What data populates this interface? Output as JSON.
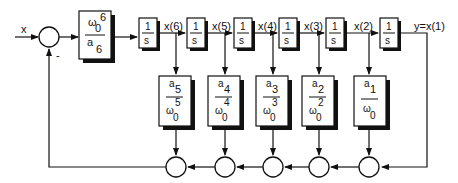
{
  "diagram": {
    "input_label": "x",
    "minus_sign": "-",
    "gain_block": {
      "num_sym": "ω",
      "num_sub": "0",
      "num_sup": "6",
      "den_sym": "a",
      "den_sub": "6"
    },
    "integrators": [
      {
        "num": "1",
        "den": "s",
        "out_label": "x(6)"
      },
      {
        "num": "1",
        "den": "s",
        "out_label": "x(5)"
      },
      {
        "num": "1",
        "den": "s",
        "out_label": "x(4)"
      },
      {
        "num": "1",
        "den": "s",
        "out_label": "x(3)"
      },
      {
        "num": "1",
        "den": "s",
        "out_label": "x(2)"
      },
      {
        "num": "1",
        "den": "s",
        "out_label": "y=x(1)"
      }
    ],
    "coefficients": [
      {
        "a_sym": "a",
        "a_sub": "5",
        "w_sym": "ω",
        "w_sub": "0",
        "w_sup": "5"
      },
      {
        "a_sym": "a",
        "a_sub": "4",
        "w_sym": "ω",
        "w_sub": "0",
        "w_sup": "4"
      },
      {
        "a_sym": "a",
        "a_sub": "3",
        "w_sym": "ω",
        "w_sub": "0",
        "w_sup": "3"
      },
      {
        "a_sym": "a",
        "a_sub": "2",
        "w_sym": "ω",
        "w_sub": "0",
        "w_sup": "2"
      },
      {
        "a_sym": "a",
        "a_sub": "1",
        "w_sym": "ω",
        "w_sub": "0",
        "w_sup": ""
      }
    ]
  }
}
